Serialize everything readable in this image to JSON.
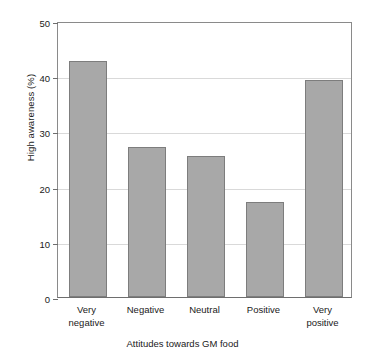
{
  "chart_data": {
    "type": "bar",
    "title": "",
    "xlabel": "Attitudes towards GM food",
    "ylabel": "High awareness (%)",
    "categories": [
      "Very negative",
      "Negative",
      "Neutral",
      "Positive",
      "Very positive"
    ],
    "category_lines": [
      [
        "Very",
        "negative"
      ],
      [
        "Negative"
      ],
      [
        "Neutral"
      ],
      [
        "Positive"
      ],
      [
        "Very",
        "positive"
      ]
    ],
    "values": [
      42.7,
      27.2,
      25.5,
      17.2,
      39.4
    ],
    "ylim": [
      0,
      50
    ],
    "yticks": [
      0,
      10,
      20,
      30,
      40,
      50
    ],
    "ytick_labels": [
      "0",
      "10",
      "20",
      "30",
      "40",
      "50"
    ],
    "gridlines": [
      10,
      20,
      30,
      40
    ],
    "grid": true,
    "legend": "none",
    "colors": {
      "bar_fill": "#a8a8a8",
      "bar_edge": "#7d7d7d",
      "gridline": "#d9d9d9",
      "axis": "#6e6e6e",
      "text": "#1a1a1a",
      "background": "#ffffff"
    }
  }
}
